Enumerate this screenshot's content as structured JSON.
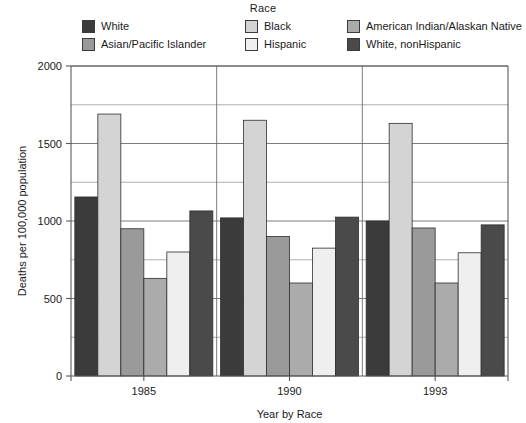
{
  "legend": {
    "title": "Race",
    "columns": [
      [
        {
          "label": "White",
          "color": "#3b3b3b"
        },
        {
          "label": "Asian/Pacific Islander",
          "color": "#9a9a9a"
        }
      ],
      [
        {
          "label": "Black",
          "color": "#d4d4d4"
        },
        {
          "label": "Hispanic",
          "color": "#efefef"
        }
      ],
      [
        {
          "label": "American Indian/Alaskan Native",
          "color": "#ababab"
        },
        {
          "label": "White, nonHispanic",
          "color": "#4a4a4a"
        }
      ]
    ]
  },
  "chart_data": {
    "type": "bar",
    "title": "Race",
    "xlabel": "Year by Race",
    "ylabel": "Deaths per 100,000 population",
    "categories": [
      "1985",
      "1990",
      "1993"
    ],
    "ylim": [
      0,
      2000
    ],
    "yticks": [
      0,
      500,
      1000,
      1500,
      2000
    ],
    "ytick_labels": [
      "0",
      "500",
      "1000",
      "1500",
      "2000"
    ],
    "minor_gridlines": [
      250,
      750,
      1250,
      1750
    ],
    "grid": true,
    "legend_position": "top",
    "series": [
      {
        "name": "White",
        "color": "#3b3b3b",
        "values": [
          1155,
          1020,
          1000
        ]
      },
      {
        "name": "Black",
        "color": "#d4d4d4",
        "values": [
          1690,
          1650,
          1630
        ]
      },
      {
        "name": "Asian/Pacific Islander",
        "color": "#9a9a9a",
        "values": [
          950,
          900,
          955
        ]
      },
      {
        "name": "American Indian/Alaskan Native",
        "color": "#ababab",
        "values": [
          630,
          600,
          600
        ]
      },
      {
        "name": "Hispanic",
        "color": "#efefef",
        "values": [
          800,
          825,
          795
        ]
      },
      {
        "name": "White, nonHispanic",
        "color": "#4a4a4a",
        "values": [
          1065,
          1025,
          975
        ]
      }
    ]
  }
}
